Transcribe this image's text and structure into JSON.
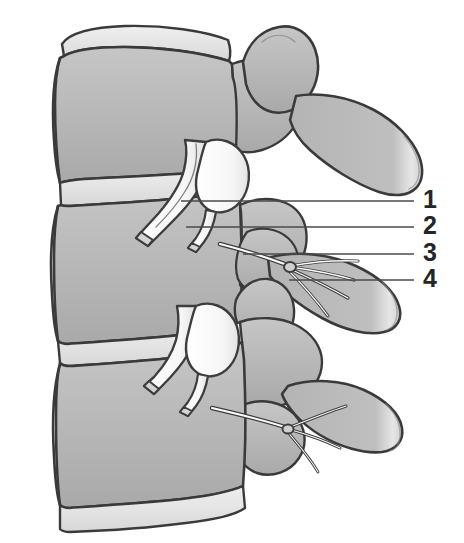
{
  "figure": {
    "background_color": "#ffffff",
    "outline_color": "#3a3a3a",
    "bone_fill": "#b8b8b8",
    "bone_fill_light": "#cccccc",
    "disc_fill": "#e8e8e8",
    "nerve_fill": "#fdfdfd",
    "nerve_outline": "#404040",
    "leader_color": "#4a4a4a",
    "label_color": "#262626"
  },
  "labels": [
    {
      "id": "1",
      "text": "1",
      "x": 427,
      "y": 187,
      "leader": {
        "x1": 181,
        "y1": 201,
        "x2": 414,
        "y2": 201
      }
    },
    {
      "id": "2",
      "text": "2",
      "x": 427,
      "y": 213,
      "leader": {
        "x1": 186,
        "y1": 227,
        "x2": 414,
        "y2": 227
      }
    },
    {
      "id": "3",
      "text": "3",
      "x": 427,
      "y": 240,
      "leader": {
        "x1": 243,
        "y1": 254,
        "x2": 414,
        "y2": 254
      }
    },
    {
      "id": "4",
      "text": "4",
      "x": 427,
      "y": 266,
      "leader": {
        "x1": 289,
        "y1": 280,
        "x2": 414,
        "y2": 280
      }
    }
  ],
  "structures": {
    "vertebral_bodies": [
      "upper-vertebral-body",
      "middle-vertebral-body",
      "lower-vertebral-body"
    ],
    "discs": [
      "upper-intervertebral-disc",
      "lower-intervertebral-disc",
      "bottom-intervertebral-disc"
    ],
    "processes": [
      "superior-articular-process",
      "transverse-process-upper",
      "transverse-process-lower",
      "inferior-articular-process"
    ],
    "nerves": [
      "spinal-nerve-root-upper",
      "spinal-nerve-root-lower",
      "dorsal-ramus-branches-upper",
      "dorsal-ramus-branches-lower",
      "ventral-ramus-upper",
      "ventral-ramus-lower"
    ]
  }
}
